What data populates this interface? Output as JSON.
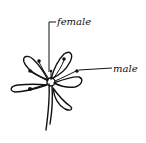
{
  "diagram": {
    "labels": [
      {
        "id": "female",
        "text": "female"
      },
      {
        "id": "male",
        "text": "male"
      }
    ]
  }
}
